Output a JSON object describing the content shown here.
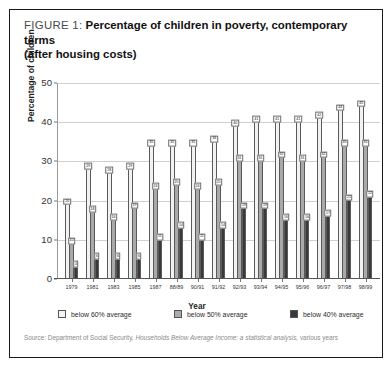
{
  "figure": {
    "label": "FIGURE 1:",
    "title_line1": "Percentage of children in poverty, contemporary terms",
    "title_line2": "(after housing costs)"
  },
  "source": {
    "prefix": "Source: Department of Social Security, ",
    "italic": "Households Below Average Income: a statistical analysis,",
    "suffix": " various years"
  },
  "legend": {
    "position": "bottom",
    "items": [
      {
        "label": "below 60% average",
        "color": "#f4f4f4",
        "key": "s60"
      },
      {
        "label": "below 50% average",
        "color": "#ababab",
        "key": "s50"
      },
      {
        "label": "below 40% average",
        "color": "#3a3a3a",
        "key": "s40"
      }
    ]
  },
  "chart_data": {
    "type": "bar",
    "title": "Percentage of children in poverty, contemporary terms (after housing costs)",
    "xlabel": "Year",
    "ylabel": "Percentage of children",
    "ylim": [
      0,
      50
    ],
    "yticks": [
      0,
      10,
      20,
      30,
      40,
      50
    ],
    "grid": true,
    "legend_position": "bottom",
    "categories": [
      "1979",
      "1981",
      "1983",
      "1985",
      "1987",
      "88/89",
      "90/91",
      "91/92",
      "92/93",
      "93/94",
      "94/95",
      "95/96",
      "96/97",
      "97/98",
      "98/99"
    ],
    "series": [
      {
        "name": "below 60% average",
        "color": "#f4f4f4",
        "values": [
          20,
          29,
          28,
          29,
          35,
          35,
          35,
          36,
          40,
          41,
          41,
          41,
          42,
          44,
          45
        ]
      },
      {
        "name": "below 50% average",
        "color": "#ababab",
        "values": [
          10,
          18,
          16,
          19,
          24,
          25,
          24,
          25,
          31,
          31,
          32,
          31,
          32,
          35,
          35
        ]
      },
      {
        "name": "below 40% average",
        "color": "#3a3a3a",
        "values": [
          4,
          6,
          6,
          6,
          11,
          14,
          11,
          14,
          19,
          19,
          16,
          16,
          17,
          21,
          22
        ]
      }
    ]
  }
}
